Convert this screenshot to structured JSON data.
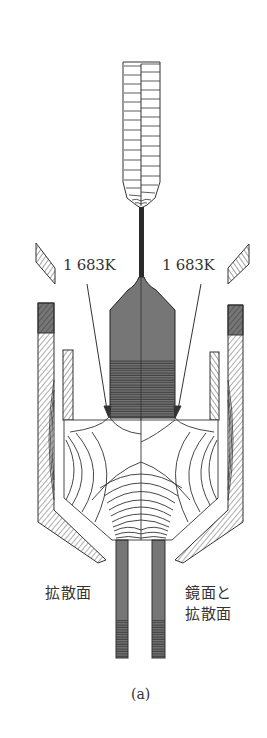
{
  "figure": {
    "caption": "(a)",
    "labels": {
      "temp_left": "1 683K",
      "temp_right": "1 683K",
      "surface_left": "拡散面",
      "surface_right_line1": "鏡面と",
      "surface_right_line2": "拡散面"
    },
    "colors": {
      "line": "#2a2a2a",
      "dense_fill": "#555555",
      "background": "#ffffff"
    }
  }
}
